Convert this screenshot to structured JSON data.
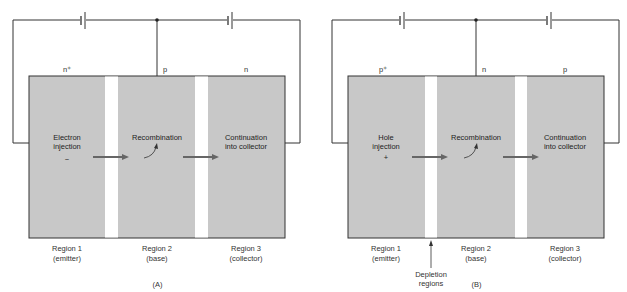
{
  "figure": {
    "panels": [
      {
        "id": "A",
        "caption": "(A)",
        "type_labels": [
          "n⁺",
          "p",
          "n"
        ],
        "region_texts": [
          {
            "line1": "Electron",
            "line2": "injection",
            "sign": "−"
          },
          {
            "line1": "Recombination",
            "line2": ""
          },
          {
            "line1": "Continuation",
            "line2": "into collector"
          }
        ],
        "region_names": [
          {
            "line1": "Region 1",
            "line2": "(emitter)"
          },
          {
            "line1": "Region 2",
            "line2": "(base)"
          },
          {
            "line1": "Region 3",
            "line2": "(collector)"
          }
        ]
      },
      {
        "id": "B",
        "caption": "(B)",
        "type_labels": [
          "p⁺",
          "n",
          "p"
        ],
        "region_texts": [
          {
            "line1": "Hole",
            "line2": "injection",
            "sign": "+"
          },
          {
            "line1": "Recombination",
            "line2": ""
          },
          {
            "line1": "Continuation",
            "line2": "into collector"
          }
        ],
        "region_names": [
          {
            "line1": "Region 1",
            "line2": "(emitter)"
          },
          {
            "line1": "Region 2",
            "line2": "(base)"
          },
          {
            "line1": "Region 3",
            "line2": "(collector)"
          }
        ],
        "annotation": {
          "line1": "Depletion",
          "line2": "regions"
        }
      }
    ],
    "colors": {
      "region_fill": "#c8c8c8",
      "depletion_fill": "#ffffff",
      "wire": "#333333",
      "arrow": "#666666"
    }
  }
}
